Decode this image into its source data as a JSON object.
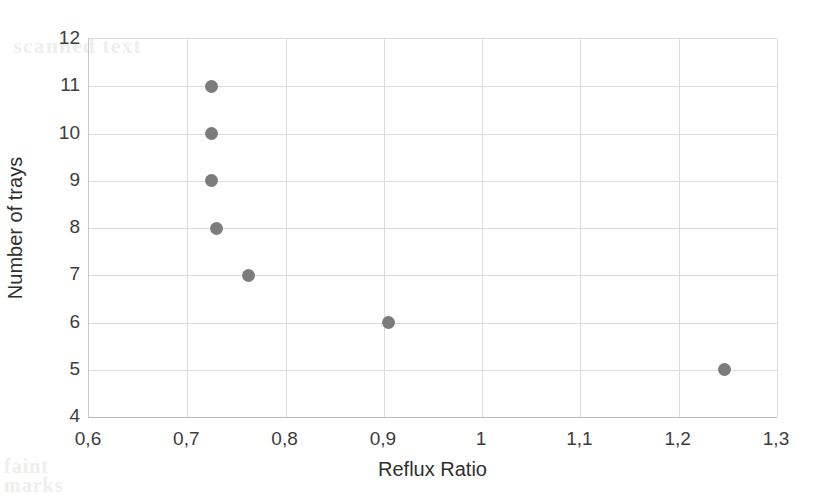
{
  "chart_data": {
    "type": "scatter",
    "title": "",
    "xlabel": "Reflux Ratio",
    "ylabel": "Number of trays",
    "xlim": [
      0.6,
      1.3
    ],
    "ylim": [
      4,
      12
    ],
    "grid": true,
    "legend": "none",
    "decimal_separator": ",",
    "marker": {
      "shape": "circle",
      "color": "#7c7c7c",
      "size_px": 13
    },
    "xticks": [
      "0,6",
      "0,7",
      "0,8",
      "0,9",
      "1",
      "1,1",
      "1,2",
      "1,3"
    ],
    "xtick_values": [
      0.6,
      0.7,
      0.8,
      0.9,
      1.0,
      1.1,
      1.2,
      1.3
    ],
    "yticks": [
      "4",
      "5",
      "6",
      "7",
      "8",
      "9",
      "10",
      "11",
      "12"
    ],
    "ytick_values": [
      4,
      5,
      6,
      7,
      8,
      9,
      10,
      11,
      12
    ],
    "series": [
      {
        "name": "Reflux ratio vs trays",
        "points": [
          {
            "x": 0.7245,
            "y": 11
          },
          {
            "x": 0.7245,
            "y": 10
          },
          {
            "x": 0.7245,
            "y": 9
          },
          {
            "x": 0.7295,
            "y": 8
          },
          {
            "x": 0.762,
            "y": 7
          },
          {
            "x": 0.905,
            "y": 6
          },
          {
            "x": 1.247,
            "y": 5
          }
        ]
      }
    ]
  },
  "artifacts": {
    "top_ghost": "scanned text",
    "bottom_ghost_1": "faint",
    "bottom_ghost_2": "marks",
    "mid_ghost": ""
  }
}
